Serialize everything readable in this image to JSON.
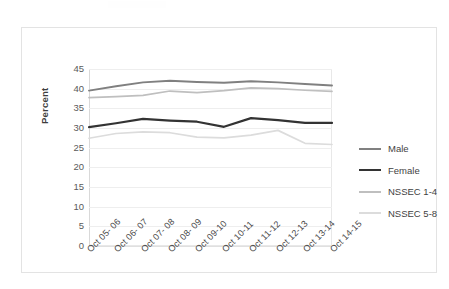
{
  "chart_data": {
    "type": "line",
    "title": "",
    "xlabel": "",
    "ylabel": "Percent",
    "ylim": [
      0,
      45
    ],
    "yticks": [
      "0",
      "5",
      "10",
      "15",
      "20",
      "25",
      "30",
      "35",
      "40",
      "45"
    ],
    "grid": true,
    "legend_position": "right",
    "categories": [
      "Oct 05- 06",
      "Oct 06- 07",
      "Oct 07- 08",
      "Oct 08- 09",
      "Oct 09-10",
      "Oct 10-11",
      "Oct 11-12",
      "Oct 12-13",
      "Oct 13-14",
      "Oct 14-15"
    ],
    "series": [
      {
        "name": "Male",
        "color": "#808080",
        "values": [
          39.5,
          40.6,
          41.6,
          42.0,
          41.7,
          41.5,
          41.9,
          41.6,
          41.2,
          40.8
        ]
      },
      {
        "name": "Female",
        "color": "#333333",
        "values": [
          30.2,
          31.2,
          32.3,
          31.9,
          31.6,
          30.3,
          32.5,
          32.0,
          31.3,
          31.3
        ]
      },
      {
        "name": "NSSEC 1-4",
        "color": "#bfbfbf",
        "values": [
          37.7,
          38.0,
          38.3,
          39.4,
          39.0,
          39.5,
          40.2,
          40.0,
          39.6,
          39.3
        ]
      },
      {
        "name": "NSSEC 5-8",
        "color": "#dcdcdc",
        "values": [
          27.4,
          28.6,
          29.0,
          28.8,
          27.7,
          27.5,
          28.2,
          29.4,
          26.1,
          25.8
        ]
      }
    ]
  }
}
